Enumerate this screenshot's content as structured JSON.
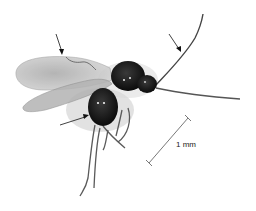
{
  "figure": {
    "scale_bar": {
      "label": "1 mm"
    },
    "annotations": [
      {
        "name": "wing-vein-arrow"
      },
      {
        "name": "antenna-arrow"
      },
      {
        "name": "gaster-arrow"
      }
    ],
    "colors": {
      "background": "#ffffff",
      "body": "#111111",
      "wing": "#bdbdbd",
      "line": "#333333"
    }
  }
}
